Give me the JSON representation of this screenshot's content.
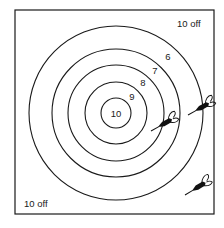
{
  "diagram": {
    "type": "scoring-target",
    "frame": {
      "x": 15,
      "y": 10,
      "width": 199,
      "height": 204
    },
    "center": {
      "x": 116,
      "y": 113
    },
    "rings": [
      {
        "score": "10",
        "radius": 15,
        "label_pos": {
          "x": 116,
          "y": 116
        }
      },
      {
        "score": "9",
        "radius": 31,
        "label_pos": {
          "x": 132,
          "y": 100
        }
      },
      {
        "score": "8",
        "radius": 48,
        "label_pos": {
          "x": 143,
          "y": 86
        }
      },
      {
        "score": "7",
        "radius": 64,
        "label_pos": {
          "x": 155,
          "y": 74
        }
      },
      {
        "score": "6",
        "radius": 87,
        "label_pos": {
          "x": 168,
          "y": 60
        }
      }
    ],
    "corner_labels": [
      {
        "text": "10 off",
        "position": "top-right",
        "x": 177,
        "y": 27
      },
      {
        "text": "10 off",
        "position": "bottom-left",
        "x": 24,
        "y": 207
      }
    ],
    "darts": [
      {
        "id": "dart-1",
        "tip": {
          "x": 151,
          "y": 131
        },
        "tail": {
          "x": 176,
          "y": 117
        },
        "location": "on ring 7 boundary"
      },
      {
        "id": "dart-2",
        "tip": {
          "x": 188,
          "y": 115
        },
        "tail": {
          "x": 213,
          "y": 101
        },
        "location": "on outer ring 6 boundary"
      },
      {
        "id": "dart-3",
        "tip": {
          "x": 185,
          "y": 195
        },
        "tail": {
          "x": 210,
          "y": 180
        },
        "location": "outside rings, bottom-right corner"
      }
    ],
    "colors": {
      "ink": "#1a1a1a",
      "background": "#ffffff"
    }
  }
}
